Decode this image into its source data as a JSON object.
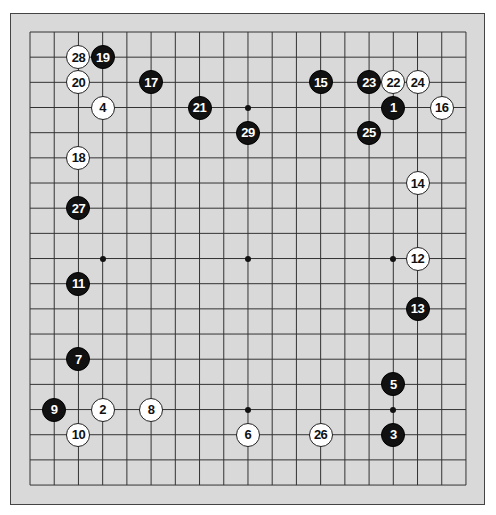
{
  "board": {
    "size": 19,
    "grid": {
      "x0": 30,
      "y0": 32,
      "dx": 24.22,
      "dy": 25.17
    },
    "colors": {
      "background": "#d9d9d9",
      "lines": "#333333",
      "frame": "#444444",
      "black_stone": "#111111",
      "white_stone": "#ffffff"
    },
    "star_points": [
      {
        "col": 9,
        "row": 3
      },
      {
        "col": 3,
        "row": 9
      },
      {
        "col": 9,
        "row": 9
      },
      {
        "col": 15,
        "row": 9
      },
      {
        "col": 9,
        "row": 15
      },
      {
        "col": 15,
        "row": 15
      }
    ],
    "stones": [
      {
        "n": "1",
        "color": "black",
        "col": 15,
        "row": 3
      },
      {
        "n": "2",
        "color": "white",
        "col": 3,
        "row": 15
      },
      {
        "n": "3",
        "color": "black",
        "col": 15,
        "row": 16
      },
      {
        "n": "4",
        "color": "white",
        "col": 3,
        "row": 3
      },
      {
        "n": "5",
        "color": "black",
        "col": 15,
        "row": 14
      },
      {
        "n": "6",
        "color": "white",
        "col": 9,
        "row": 16
      },
      {
        "n": "7",
        "color": "black",
        "col": 2,
        "row": 13
      },
      {
        "n": "8",
        "color": "white",
        "col": 5,
        "row": 15
      },
      {
        "n": "9",
        "color": "black",
        "col": 1,
        "row": 15
      },
      {
        "n": "10",
        "color": "white",
        "col": 2,
        "row": 16
      },
      {
        "n": "11",
        "color": "black",
        "col": 2,
        "row": 10
      },
      {
        "n": "12",
        "color": "white",
        "col": 16,
        "row": 9
      },
      {
        "n": "13",
        "color": "black",
        "col": 16,
        "row": 11
      },
      {
        "n": "14",
        "color": "white",
        "col": 16,
        "row": 6
      },
      {
        "n": "15",
        "color": "black",
        "col": 12,
        "row": 2
      },
      {
        "n": "16",
        "color": "white",
        "col": 17,
        "row": 3
      },
      {
        "n": "17",
        "color": "black",
        "col": 5,
        "row": 2
      },
      {
        "n": "18",
        "color": "white",
        "col": 2,
        "row": 5
      },
      {
        "n": "19",
        "color": "black",
        "col": 3,
        "row": 1
      },
      {
        "n": "20",
        "color": "white",
        "col": 2,
        "row": 2
      },
      {
        "n": "21",
        "color": "black",
        "col": 7,
        "row": 3
      },
      {
        "n": "22",
        "color": "white",
        "col": 15,
        "row": 2
      },
      {
        "n": "23",
        "color": "black",
        "col": 14,
        "row": 2
      },
      {
        "n": "24",
        "color": "white",
        "col": 16,
        "row": 2
      },
      {
        "n": "25",
        "color": "black",
        "col": 14,
        "row": 4
      },
      {
        "n": "26",
        "color": "white",
        "col": 12,
        "row": 16
      },
      {
        "n": "27",
        "color": "black",
        "col": 2,
        "row": 7
      },
      {
        "n": "28",
        "color": "white",
        "col": 2,
        "row": 1
      },
      {
        "n": "29",
        "color": "black",
        "col": 9,
        "row": 4
      }
    ]
  }
}
